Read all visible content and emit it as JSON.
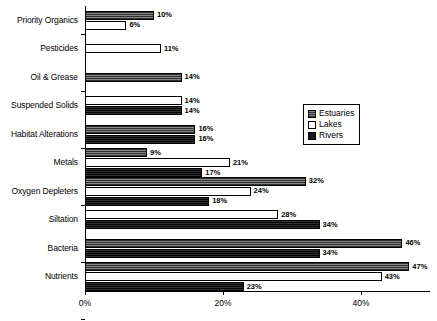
{
  "chart_data": {
    "type": "bar",
    "orientation": "horizontal",
    "title": "",
    "xlabel": "",
    "ylabel": "",
    "xlim": [
      0,
      50
    ],
    "grid": false,
    "legend_position": "right-middle",
    "tick_labels": [
      "0%",
      "20%",
      "40%"
    ],
    "tick_values": [
      0,
      20,
      40
    ],
    "categories": [
      "Priority Organics",
      "Pesticides",
      "Oil & Grease",
      "Suspended Solids",
      "Habitat Alterations",
      "Metals",
      "Oxygen Depleters",
      "Siltation",
      "Bacteria",
      "Nutrients"
    ],
    "series": [
      {
        "name": "Estuaries",
        "color": "#6b6b6b",
        "values": [
          10,
          null,
          14,
          null,
          16,
          9,
          32,
          null,
          46,
          47
        ],
        "labels": [
          "10%",
          "",
          "14%",
          "",
          "16%",
          "9%",
          "32%",
          "",
          "46%",
          "47%"
        ]
      },
      {
        "name": "Lakes",
        "color": "#ffffff",
        "values": [
          6,
          11,
          null,
          14,
          null,
          21,
          24,
          28,
          null,
          43
        ],
        "labels": [
          "6%",
          "11%",
          "",
          "14%",
          "",
          "21%",
          "24%",
          "28%",
          "",
          "43%"
        ]
      },
      {
        "name": "Rivers",
        "color": "#1a1a1a",
        "values": [
          null,
          null,
          null,
          14,
          16,
          17,
          18,
          34,
          34,
          23
        ],
        "labels": [
          "",
          "",
          "",
          "14%",
          "16%",
          "17%",
          "18%",
          "34%",
          "34%",
          "23%"
        ]
      }
    ]
  },
  "legend": {
    "items": [
      {
        "label": "Estuaries",
        "key": "estuaries"
      },
      {
        "label": "Lakes",
        "key": "lakes"
      },
      {
        "label": "Rivers",
        "key": "rivers"
      }
    ]
  }
}
